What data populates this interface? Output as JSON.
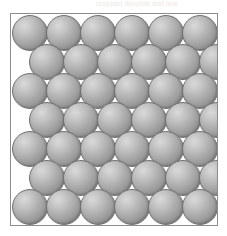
{
  "figure": {
    "name": "close-packed-sphere-array",
    "caption_fragment": "cropped illegible text line",
    "background_color": "#ffffff",
    "width": 227,
    "height": 236
  },
  "frame": {
    "name": "packing-frame",
    "border_color": "#8d8d8d",
    "border_width": 1,
    "fill_color": "#ffffff",
    "left": 10,
    "top": 13,
    "width": 208,
    "height": 213
  },
  "spheres": {
    "diameter": 36,
    "fill_light": "#d9d9d9",
    "fill_mid": "#a2a2a2",
    "fill_dark": "#6a6a6a",
    "outline_color": "#717171",
    "highlight_position": "upper-left",
    "packing": "hexagonal-close-packed-2d",
    "rows_total": 7,
    "columns_flush": 6,
    "columns_offset": 6,
    "row_offsets": [
      0,
      17,
      0,
      17,
      0,
      17,
      0
    ],
    "row_y": [
      1,
      30,
      59,
      88,
      117,
      146,
      175
    ],
    "row_types": [
      "flush",
      "offset",
      "flush",
      "offset",
      "flush",
      "offset",
      "flush"
    ]
  },
  "chart_data": {
    "type": "scatter",
    "xlabel": "",
    "ylabel": "",
    "grid": false,
    "legend": "none",
    "xlim": [
      0,
      208
    ],
    "ylim": [
      0,
      213
    ],
    "marker": "filled-circle-shaded",
    "marker_diameter": 36,
    "series": [
      {
        "name": "row-1",
        "row_type": "flush",
        "x": [
          19,
          53,
          87,
          121,
          155,
          189
        ],
        "y": [
          19,
          19,
          19,
          19,
          19,
          19
        ]
      },
      {
        "name": "row-2",
        "row_type": "offset",
        "x": [
          36,
          70,
          104,
          138,
          172,
          206
        ],
        "y": [
          48,
          48,
          48,
          48,
          48,
          48
        ]
      },
      {
        "name": "row-3",
        "row_type": "flush",
        "x": [
          19,
          53,
          87,
          121,
          155,
          189
        ],
        "y": [
          77,
          77,
          77,
          77,
          77,
          77
        ]
      },
      {
        "name": "row-4",
        "row_type": "offset",
        "x": [
          36,
          70,
          104,
          138,
          172,
          206
        ],
        "y": [
          106,
          106,
          106,
          106,
          106,
          106
        ]
      },
      {
        "name": "row-5",
        "row_type": "flush",
        "x": [
          19,
          53,
          87,
          121,
          155,
          189
        ],
        "y": [
          135,
          135,
          135,
          135,
          135,
          135
        ]
      },
      {
        "name": "row-6",
        "row_type": "offset",
        "x": [
          36,
          70,
          104,
          138,
          172,
          206
        ],
        "y": [
          164,
          164,
          164,
          164,
          164,
          164
        ]
      },
      {
        "name": "row-7",
        "row_type": "flush",
        "x": [
          19,
          53,
          87,
          121,
          155,
          189
        ],
        "y": [
          193,
          193,
          193,
          193,
          193,
          193
        ]
      }
    ]
  }
}
